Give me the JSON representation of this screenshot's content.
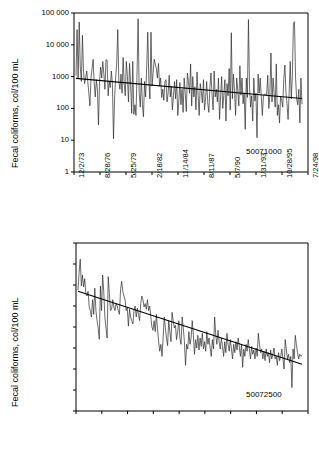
{
  "figure": {
    "panels": [
      {
        "id": "panel-top",
        "station_label": "50071000",
        "ylabel": "Fecal coliforms, col/100 mL"
      },
      {
        "id": "panel-bottom",
        "station_label": "50072500",
        "ylabel": "Fecal coliforms, col/100 mL"
      }
    ]
  },
  "chart_data": [
    {
      "type": "line",
      "title": "",
      "station": "50071000",
      "xlabel": "",
      "ylabel": "Fecal coliforms, col/100 mL",
      "yscale": "log",
      "ylim": [
        1,
        100000
      ],
      "ytick_labels": [
        "100 000",
        "10 000",
        "1000",
        "100",
        "10",
        "1"
      ],
      "ytick_values": [
        100000,
        10000,
        1000,
        100,
        10,
        1
      ],
      "xtick_labels": [
        "12/2/73",
        "8/28/76",
        "5/25/79",
        "2/18/82",
        "11/14/84",
        "8/11/87",
        "5/7/90",
        "1/31/93",
        "10/28/95",
        "7/24/98"
      ],
      "grid": false,
      "legend": "none",
      "series": [
        {
          "name": "Fecal coliform measurements",
          "values": [
            1100,
            30000,
            900,
            52000,
            2000,
            700,
            20000,
            1400,
            600,
            900,
            1500,
            700,
            300,
            120,
            900,
            1800,
            3500,
            600,
            230,
            800,
            400,
            30,
            700,
            2000,
            900,
            3000,
            1200,
            400,
            3400,
            3300,
            250,
            700,
            450,
            1500,
            600,
            11,
            200,
            900,
            2500,
            30000,
            700,
            400,
            1200,
            300,
            4000,
            600,
            250,
            3000,
            1000,
            160,
            2600,
            600,
            70,
            3000,
            65,
            130,
            60,
            1400,
            66000,
            300,
            110,
            900,
            130,
            55,
            700,
            230,
            2000,
            25000,
            800,
            200,
            25000,
            500,
            1300,
            3500,
            2500,
            1800,
            900,
            2600,
            500,
            900,
            220,
            400,
            180,
            700,
            800,
            160,
            300,
            1100,
            230,
            500,
            90,
            250,
            700,
            200,
            800,
            60,
            170,
            650,
            130,
            400,
            75,
            900,
            300,
            80,
            1300,
            700,
            300,
            2500,
            120,
            1000,
            230,
            480,
            90,
            1400,
            260,
            60,
            600,
            340,
            150,
            800,
            90,
            210,
            700,
            150,
            75,
            450,
            1300,
            280,
            90,
            1500,
            230,
            400,
            160,
            900,
            45,
            230,
            1000,
            100,
            260,
            800,
            40,
            600,
            250,
            1800,
            90,
            24000,
            200,
            1200,
            350,
            60,
            900,
            400,
            120,
            2200,
            260,
            900,
            140,
            300,
            22,
            900,
            220,
            62000,
            500,
            110,
            250,
            40,
            900,
            170,
            300,
            12,
            1200,
            300,
            900,
            220,
            60,
            250,
            280,
            280,
            270,
            1100,
            100,
            260,
            5500,
            160,
            900,
            300,
            110,
            2500,
            60,
            130,
            35,
            240,
            180,
            110,
            800,
            2300,
            320,
            140,
            45,
            300,
            3000,
            200,
            1100,
            48000,
            53000,
            900,
            200,
            130,
            400,
            35,
            900,
            140
          ]
        }
      ],
      "trend_line": {
        "name": "log-linear trend",
        "start_value": 880,
        "end_value": 205
      }
    },
    {
      "type": "line",
      "title": "",
      "station": "50072500",
      "xlabel": "",
      "ylabel": "Fecal coliforms, col/100 mL",
      "yscale": "log",
      "ylim": [
        1,
        100000000
      ],
      "ytick_labels": [
        "100 000 000",
        "10 000 000",
        "1 000 000",
        "100 000",
        "10 000",
        "1000",
        "100",
        "10",
        "1"
      ],
      "ytick_values": [
        100000000,
        10000000,
        1000000,
        100000,
        10000,
        1000,
        100,
        10,
        1
      ],
      "xtick_labels": [
        "12/2/73",
        "8/28/76",
        "5/25/79",
        "2/18/82",
        "11/14/84",
        "8/11/87",
        "5/7/90",
        "1/31/93",
        "10/28/95",
        "7/24/98"
      ],
      "grid": false,
      "legend": "none",
      "series": [
        {
          "name": "Fecal coliform measurements",
          "values": [
            600000,
            4000000,
            17000000,
            900000,
            3000000,
            800000,
            2000000,
            400000,
            300000,
            500000,
            90000,
            60000,
            30000,
            200000,
            40000,
            700000,
            60000,
            20000,
            9000,
            2600,
            900000,
            60000,
            3000000,
            500000,
            30000,
            9000,
            3000,
            2500000,
            400000,
            60000,
            70000,
            200000,
            90000,
            60000,
            130000,
            100000,
            60000,
            40000,
            600000,
            1500000,
            500000,
            300000,
            200000,
            60000,
            80000,
            11000,
            70000,
            30000,
            20000,
            14000,
            60000,
            100000,
            30000,
            80000,
            40000,
            20000,
            130000,
            300000,
            200000,
            90000,
            130000,
            70000,
            200000,
            60000,
            100000,
            30000,
            10000,
            7000,
            20000,
            6000,
            40000,
            8000,
            2000,
            700,
            1500,
            400,
            3000,
            30000,
            9000,
            3000,
            1300,
            20000,
            6000,
            2000,
            50000,
            20000,
            9000,
            12000,
            2500,
            6000,
            20000,
            3000,
            1500,
            30000,
            9000,
            2000,
            150,
            1500,
            900,
            6000,
            1500,
            3000,
            20000,
            4000,
            500,
            2500,
            1000,
            4000,
            800,
            3000,
            1200,
            5000,
            900,
            2000,
            700,
            6000,
            1500,
            3000,
            1000,
            400,
            2500,
            900,
            30000,
            4000,
            1500,
            7000,
            2000,
            900,
            3000,
            1200,
            400,
            2000,
            600,
            5000,
            1500,
            700,
            2500,
            900,
            300,
            1500,
            600,
            2000,
            800,
            3000,
            1200,
            400,
            1500,
            120,
            900,
            400,
            1500,
            700,
            2500,
            900,
            300,
            1200,
            500,
            800,
            300,
            1000,
            400,
            5000,
            1500,
            600,
            900,
            300,
            700,
            250,
            900,
            400,
            600,
            200,
            800,
            300,
            500,
            1000,
            300,
            400,
            150,
            600,
            250,
            400,
            900,
            300,
            100,
            2500,
            900,
            300,
            500,
            200,
            400,
            13,
            900,
            300,
            4000,
            1500,
            600,
            300,
            500,
            400,
            450
          ]
        }
      ],
      "trend_line": {
        "name": "log-linear trend",
        "start_value": 500000,
        "end_value": 170
      }
    }
  ]
}
